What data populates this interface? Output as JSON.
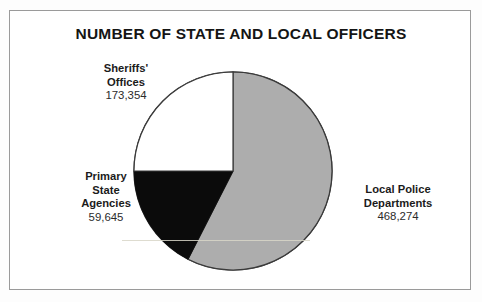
{
  "figure": {
    "title": "NUMBER OF STATE AND LOCAL OFFICERS",
    "frame_color": "#9a9a9a",
    "background": "#ffffff"
  },
  "chart_data": {
    "type": "pie",
    "title": "NUMBER OF STATE AND LOCAL OFFICERS",
    "xlabel": "",
    "ylabel": "",
    "legend_position": "callout-labels",
    "grid": false,
    "total": 701273,
    "categories": [
      "Local Police Departments",
      "Sheriffs' Offices",
      "Primary State Agencies"
    ],
    "values": [
      468274,
      173354,
      59645
    ],
    "value_labels": [
      "468,274",
      "173,354",
      "59,645"
    ],
    "colors": [
      "#adadad",
      "#ffffff",
      "#0b0b0b"
    ],
    "slices": [
      {
        "label": "Local Police Departments",
        "value": 468274,
        "value_label": "468,274",
        "color": "#adadad",
        "start_angle_deg": 0,
        "end_angle_deg": 207,
        "label_position": "right"
      },
      {
        "label": "Primary State Agencies",
        "value": 59645,
        "value_label": "59,645",
        "color": "#0b0b0b",
        "start_angle_deg": 207,
        "end_angle_deg": 270,
        "label_position": "left"
      },
      {
        "label": "Sheriffs' Offices",
        "value": 173354,
        "value_label": "173,354",
        "color": "#ffffff",
        "start_angle_deg": 270,
        "end_angle_deg": 360,
        "label_position": "upper-left"
      }
    ]
  },
  "callouts": {
    "sheriffs": {
      "line1": "Sheriffs'",
      "line2": "Offices",
      "value": "173,354"
    },
    "primary": {
      "line1": "Primary",
      "line2": "State",
      "line3": "Agencies",
      "value": "59,645"
    },
    "local": {
      "line1": "Local Police",
      "line2": "Departments",
      "value": "468,274"
    }
  }
}
